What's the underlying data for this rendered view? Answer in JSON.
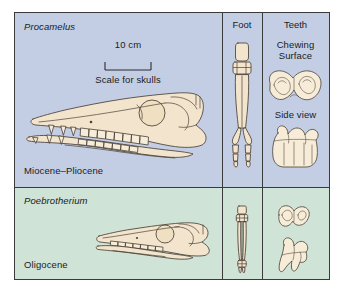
{
  "figure": {
    "columns": {
      "foot_header": "Foot",
      "teeth_header": "Teeth"
    },
    "scale": {
      "value_label": "10 cm",
      "caption": "Scale for skulls"
    },
    "teeth_labels": {
      "chewing_line1": "Chewing",
      "chewing_line2": "Surface",
      "side_view": "Side view"
    },
    "rows": [
      {
        "genus": "Procamelus",
        "epoch": "Miocene–Pliocene",
        "background_color": "#c3cee4",
        "skull_name": "procamelus-skull",
        "foot_name": "procamelus-foot",
        "teeth_chewing_name": "procamelus-chewing-surface-tooth",
        "teeth_side_name": "procamelus-side-view-tooth"
      },
      {
        "genus": "Poebrotherium",
        "epoch": "Oligocene",
        "background_color": "#cfe3d6",
        "skull_name": "poebrotherium-skull",
        "foot_name": "poebrotherium-foot",
        "teeth_chewing_name": "poebrotherium-chewing-surface-tooth",
        "teeth_side_name": "poebrotherium-side-view-tooth"
      }
    ],
    "colors": {
      "border": "#3a3a3a",
      "bone_fill": "#f3e5cd",
      "bone_stroke": "#4a4036",
      "top_panel": "#c3cee4",
      "bottom_panel": "#cfe3d6",
      "page_background": "#ffffff"
    }
  }
}
